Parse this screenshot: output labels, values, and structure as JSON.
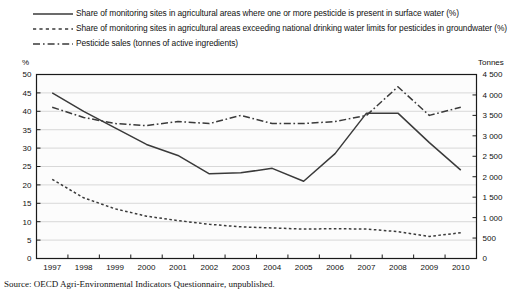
{
  "legend": {
    "items": [
      {
        "key": "solid-line-key",
        "label": "Share of monitoring sites in agricultural areas where one or more pesticide is present in surface water (%)"
      },
      {
        "key": "dotted-line-key",
        "label": "Share of monitoring sites in agricultural areas exceeding national drinking water limits for pesticides in groundwater (%)"
      },
      {
        "key": "dashdot-line-key",
        "label": "Pesticide sales (tonnes of active ingredients)"
      }
    ]
  },
  "axes": {
    "left_title": "%",
    "right_title": "Tonnes"
  },
  "source": {
    "prefix": "Source:",
    "text": "OECD Agri-Environmental Indicators Questionnaire, unpublished."
  },
  "colors": {
    "line": "#3a3a3a",
    "grid": "#c9c9c9",
    "frame": "#1a1a1a",
    "text": "#111111",
    "plot_bg": "#fcfcfc"
  },
  "chart_data": {
    "type": "line",
    "title": "",
    "xlabel": "",
    "ylabel": "%",
    "y2label": "Tonnes",
    "grid": true,
    "legend_position": "top",
    "categories": [
      "1997",
      "1998",
      "1999",
      "2000",
      "2001",
      "2002",
      "2003",
      "2004",
      "2005",
      "2006",
      "2007",
      "2008",
      "2009",
      "2010"
    ],
    "x": [
      1997,
      1998,
      1999,
      2000,
      2001,
      2002,
      2003,
      2004,
      2005,
      2006,
      2007,
      2008,
      2009,
      2010
    ],
    "ylim": [
      0,
      50
    ],
    "yticks": [
      "0",
      "5",
      "10",
      "15",
      "20",
      "25",
      "30",
      "35",
      "40",
      "45",
      "50"
    ],
    "ytick_values": [
      0,
      5,
      10,
      15,
      20,
      25,
      30,
      35,
      40,
      45,
      50
    ],
    "y2lim": [
      0,
      4500
    ],
    "y2ticks": [
      "0",
      "500",
      "1 000",
      "1 500",
      "2 000",
      "2 500",
      "3 000",
      "3 500",
      "4 000",
      "4 500"
    ],
    "y2tick_values": [
      0,
      500,
      1000,
      1500,
      2000,
      2500,
      3000,
      3500,
      4000,
      4500
    ],
    "series": [
      {
        "name": "Share of monitoring sites in agricultural areas where one or more pesticide is present in surface water (%)",
        "axis": "left",
        "style": "solid",
        "values": [
          45.0,
          40.0,
          35.5,
          31.0,
          28.0,
          23.0,
          23.3,
          24.5,
          21.0,
          28.5,
          39.5,
          39.5,
          31.5,
          24.0
        ]
      },
      {
        "name": "Share of monitoring sites in agricultural areas exceeding national drinking water limits for pesticides in groundwater (%)",
        "axis": "left",
        "style": "dotted",
        "values": [
          21.5,
          16.5,
          13.5,
          11.5,
          10.3,
          9.3,
          8.6,
          8.3,
          8.0,
          8.1,
          8.0,
          7.3,
          6.0,
          7.0
        ]
      },
      {
        "name": "Pesticide sales (tonnes of active ingredients)",
        "axis": "right",
        "style": "dashdot",
        "values": [
          3700,
          3450,
          3300,
          3250,
          3350,
          3300,
          3500,
          3300,
          3300,
          3350,
          3500,
          4200,
          3500,
          3700
        ]
      }
    ]
  }
}
